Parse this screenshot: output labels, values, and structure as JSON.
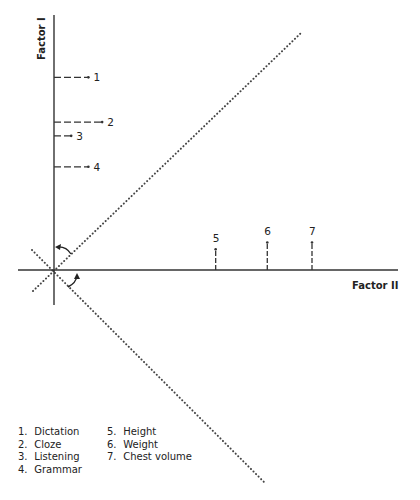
{
  "chart_data": {
    "type": "scatter",
    "title": "",
    "xlabel": "Factor II",
    "ylabel": "Factor I",
    "grid": false,
    "units_note": "approximate loadings, relative units (horizontal axis visible length ≈ 1.0)",
    "factor_I_items": [
      {
        "id": "1",
        "factor_I": 0.56,
        "factor_II": 0.1
      },
      {
        "id": "2",
        "factor_I": 0.43,
        "factor_II": 0.14
      },
      {
        "id": "3",
        "factor_I": 0.39,
        "factor_II": 0.05
      },
      {
        "id": "4",
        "factor_I": 0.3,
        "factor_II": 0.1
      }
    ],
    "factor_II_items": [
      {
        "id": "5",
        "factor_II": 0.47,
        "factor_I": 0.06
      },
      {
        "id": "6",
        "factor_II": 0.62,
        "factor_I": 0.08
      },
      {
        "id": "7",
        "factor_II": 0.75,
        "factor_I": 0.08
      }
    ],
    "rotated_axes": "dotted lines at ±45° through the origin, with curved arrows indicating rotation toward Factor I and Factor II",
    "legend_placement": "bottom-left"
  },
  "labels": {
    "factor_I": "Factor I",
    "factor_II": "Factor II"
  },
  "legend": {
    "left": [
      {
        "num": "1.",
        "name": "Dictation"
      },
      {
        "num": "2.",
        "name": "Cloze"
      },
      {
        "num": "3.",
        "name": "Listening"
      },
      {
        "num": "4.",
        "name": "Grammar"
      }
    ],
    "right": [
      {
        "num": "5.",
        "name": "Height"
      },
      {
        "num": "6.",
        "name": "Weight"
      },
      {
        "num": "7.",
        "name": "Chest volume"
      }
    ]
  }
}
